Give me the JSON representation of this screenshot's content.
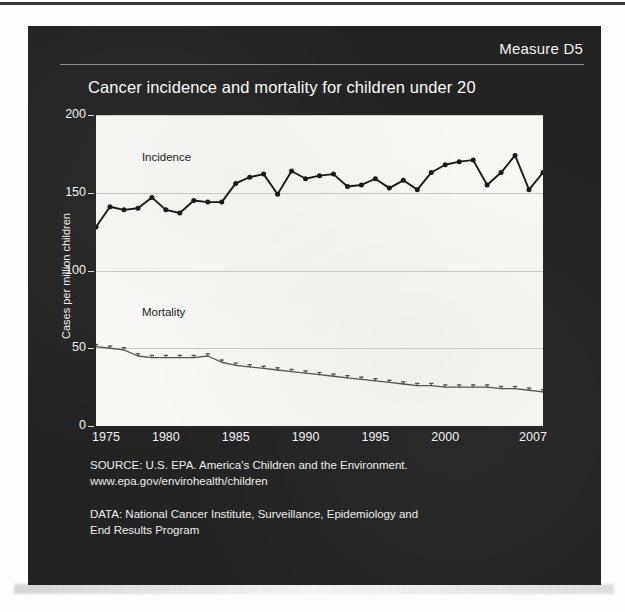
{
  "page": {
    "measure_label": "Measure D5"
  },
  "chart_data": {
    "type": "line",
    "title": "Cancer incidence and mortality for children under 20",
    "xlabel": "",
    "ylabel": "Cases per million children",
    "xlim": [
      1975,
      2007
    ],
    "ylim": [
      0,
      200
    ],
    "yticks": [
      0,
      50,
      100,
      150,
      200
    ],
    "xticks": [
      1975,
      1980,
      1985,
      1990,
      1995,
      2000,
      2007
    ],
    "grid": true,
    "legend_position": "inline-annotations",
    "x": [
      1975,
      1976,
      1977,
      1978,
      1979,
      1980,
      1981,
      1982,
      1983,
      1984,
      1985,
      1986,
      1987,
      1988,
      1989,
      1990,
      1991,
      1992,
      1993,
      1994,
      1995,
      1996,
      1997,
      1998,
      1999,
      2000,
      2001,
      2002,
      2003,
      2004,
      2005,
      2006,
      2007
    ],
    "series": [
      {
        "name": "Incidence",
        "color": "#1a1a1a",
        "marker": "circle",
        "values": [
          128,
          141,
          139,
          140,
          147,
          139,
          137,
          145,
          144,
          144,
          156,
          160,
          162,
          149,
          164,
          159,
          161,
          162,
          154,
          155,
          159,
          153,
          158,
          152,
          163,
          168,
          170,
          171,
          155,
          163,
          174,
          152,
          163
        ]
      },
      {
        "name": "Mortality",
        "color": "#555555",
        "marker": "tick",
        "values": [
          51,
          50,
          49,
          45,
          44,
          44,
          44,
          44,
          45,
          41,
          39,
          38,
          37,
          36,
          35,
          34,
          33,
          32,
          31,
          30,
          29,
          28,
          27,
          26,
          26,
          25,
          25,
          25,
          25,
          24,
          24,
          23,
          22
        ]
      }
    ],
    "annotations": [
      {
        "text": "Incidence",
        "x": 1978,
        "y": 172
      },
      {
        "text": "Mortality",
        "x": 1978,
        "y": 72
      }
    ]
  },
  "footnotes": {
    "source_line1": "SOURCE: U.S. EPA. America's Children and the Environment.",
    "source_line2": "www.epa.gov/envirohealth/children",
    "data_line1": "DATA: National Cancer Institute, Surveillance, Epidemiology and",
    "data_line2": "End Results Program"
  },
  "colors": {
    "panel_background": "#232323",
    "plot_background": "#f7f7f5",
    "incidence": "#1a1a1a",
    "mortality": "#555555",
    "gridline": "#c9c9c9",
    "text": "#f2f2f2"
  }
}
